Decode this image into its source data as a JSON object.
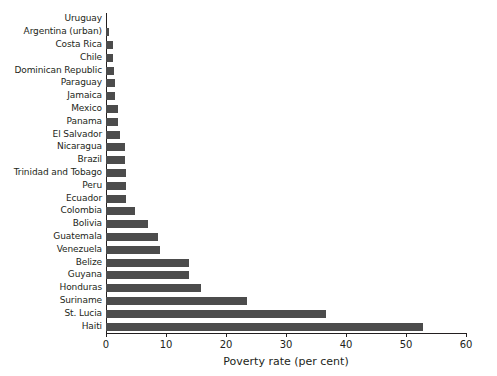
{
  "chart_data": {
    "type": "bar",
    "orientation": "horizontal",
    "title": "",
    "subtitle": "",
    "xlabel": "Poverty rate (per cent)",
    "ylabel": "",
    "xlim": [
      0,
      60
    ],
    "xticks": [
      0,
      10,
      20,
      30,
      40,
      50,
      60
    ],
    "xtick_labels": [
      "0",
      "10",
      "20",
      "30",
      "40",
      "50",
      "60"
    ],
    "grid": false,
    "legend": null,
    "bar_color": "#4c4c4c",
    "axis_color": "#231f20",
    "background_color": "#ffffff",
    "categories": [
      "Uruguay",
      "Argentina (urban)",
      "Costa Rica",
      "Chile",
      "Dominican Republic",
      "Paraguay",
      "Jamaica",
      "Mexico",
      "Panama",
      "El Salvador",
      "Nicaragua",
      "Brazil",
      "Trinidad and Tobago",
      "Peru",
      "Ecuador",
      "Colombia",
      "Bolivia",
      "Guatemala",
      "Venezuela",
      "Belize",
      "Guyana",
      "Honduras",
      "Suriname",
      "St. Lucia",
      "Haiti"
    ],
    "values": [
      0.0,
      0.5,
      1.1,
      1.1,
      1.4,
      1.5,
      1.5,
      2.0,
      2.0,
      2.3,
      3.2,
      3.2,
      3.3,
      3.4,
      3.4,
      4.8,
      7.0,
      8.6,
      9.0,
      13.8,
      13.8,
      15.8,
      23.5,
      36.7,
      52.8
    ]
  }
}
